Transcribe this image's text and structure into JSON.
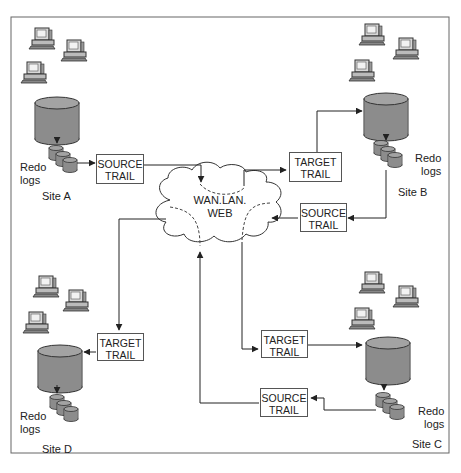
{
  "diagram": {
    "cloud": {
      "line1": "WAN.LAN.",
      "line2": "WEB"
    },
    "colors": {
      "db_fill": "#8c8c8c",
      "db_top": "#a8a8a8",
      "line": "#444444",
      "border": "#666666"
    },
    "sites": [
      {
        "id": "A",
        "label": "Site A",
        "redo_line1": "Redo",
        "redo_line2": "logs",
        "trail": {
          "line1": "SOURCE",
          "line2": "TRAIL"
        }
      },
      {
        "id": "B",
        "label": "Site B",
        "redo_line1": "Redo",
        "redo_line2": "logs",
        "trails": [
          {
            "line1": "TARGET",
            "line2": "TRAIL"
          },
          {
            "line1": "SOURCE",
            "line2": "TRAIL"
          }
        ]
      },
      {
        "id": "C",
        "label": "Site C",
        "redo_line1": "Redo",
        "redo_line2": "logs",
        "trails": [
          {
            "line1": "TARGET",
            "line2": "TRAIL"
          },
          {
            "line1": "SOURCE",
            "line2": "TRAIL"
          }
        ]
      },
      {
        "id": "D",
        "label": "Site D",
        "redo_line1": "Redo",
        "redo_line2": "logs",
        "trail": {
          "line1": "TARGET",
          "line2": "TRAIL"
        }
      }
    ]
  }
}
